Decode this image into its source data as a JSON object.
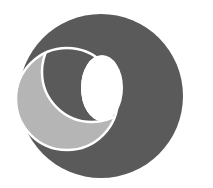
{
  "logo": {
    "description": "circular emblem with crescent and eclipse shapes",
    "colors": {
      "background": "#ffffff",
      "outer_disc": "#5a5a5a",
      "crescent_light": "#b5b5b5",
      "inner_disc": "#5a5a5a",
      "hole": "#ffffff",
      "stroke": "#ffffff"
    }
  }
}
